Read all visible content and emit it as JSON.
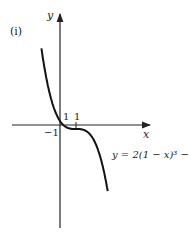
{
  "figure_label": "(i)",
  "axes": {
    "x_label": "x",
    "y_label": "y"
  },
  "ticks": {
    "x_neg_label": "−1",
    "x_pos_label": "1",
    "y_pos_label": "1"
  },
  "equation": "y = 2(1 − x)³ − 1",
  "chart_data": {
    "type": "line",
    "title": "",
    "function": "y = 2(1 - x)^3 - 1",
    "xlabel": "x",
    "ylabel": "y",
    "xlim": [
      -3.5,
      5.5
    ],
    "ylim": [
      -11,
      11
    ],
    "key_points": [
      {
        "x": 0,
        "y": 1
      },
      {
        "x": 1,
        "y": -1
      },
      {
        "x": 0.21,
        "y": 0
      }
    ],
    "tick_labels": [
      "-1",
      "1",
      "1"
    ],
    "grid": false
  }
}
